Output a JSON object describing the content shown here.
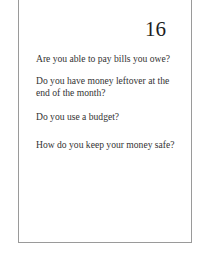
{
  "card": {
    "page_number": "16",
    "questions": [
      "Are you able to pay bills you owe?",
      "Do you have money leftover at the end of the month?",
      "Do you use a budget?",
      "How do you keep your money safe?"
    ]
  }
}
